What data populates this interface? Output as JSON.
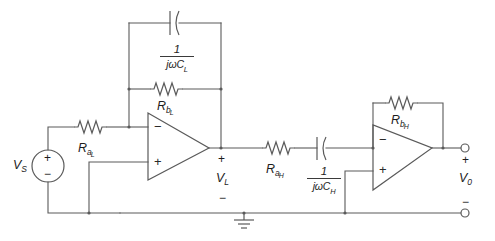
{
  "diagram": {
    "background_color": "#ffffff",
    "line_color": "#5a5a5a",
    "text_color": "#1d1d1d"
  },
  "source": {
    "name": "voltage-source",
    "label": "V",
    "label_sub": "S",
    "plus": "+",
    "minus": "−"
  },
  "stage_low": {
    "input_resistor": {
      "label": "R",
      "sub": "a",
      "sub2": "L"
    },
    "feedback_resistor": {
      "label": "R",
      "sub": "b",
      "sub2": "L"
    },
    "feedback_capacitor": {
      "numerator": "1",
      "denominator_j": "j",
      "denominator_omega": "ω",
      "denominator_c": "C",
      "denominator_sub": "L"
    },
    "opamp": {
      "name": "opamp-low",
      "inverting": "−",
      "noninverting": "+"
    },
    "output_node": {
      "label": "V",
      "sub": "L",
      "plus": "+",
      "minus": "−"
    }
  },
  "stage_high": {
    "input_resistor": {
      "label": "R",
      "sub": "a",
      "sub2": "H"
    },
    "input_capacitor": {
      "numerator": "1",
      "denominator_j": "j",
      "denominator_omega": "ω",
      "denominator_c": "C",
      "denominator_sub": "H"
    },
    "feedback_resistor": {
      "label": "R",
      "sub": "b",
      "sub2": "H"
    },
    "opamp": {
      "name": "opamp-high",
      "inverting": "−",
      "noninverting": "+"
    }
  },
  "output": {
    "label": "V",
    "sub": "0",
    "plus": "+",
    "minus": "−"
  },
  "ground": {
    "name": "ground-symbol"
  }
}
